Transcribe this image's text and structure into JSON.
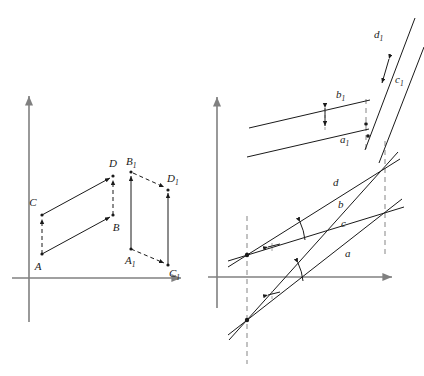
{
  "figure": {
    "type": "geometric-diagram",
    "title": "",
    "background_color": "#ffffff",
    "stroke_color": "#1a1a1a",
    "axis_color": "#808080",
    "dash_color": "#9a9a9a",
    "width": 424,
    "height": 376
  },
  "panels": [
    {
      "id": "left",
      "name": "point-figure-panel",
      "axes": {
        "origin": {
          "x": 29,
          "y": 278
        },
        "y_axis": {
          "x": 29,
          "y_top": 92,
          "y_bottom": 322,
          "arrow": "up"
        },
        "x_axis": {
          "y": 278,
          "x_left": 12,
          "x_right": 186,
          "arrow": "right"
        }
      },
      "shapes": [
        {
          "name": "parallelogram-ABCD",
          "points": [
            {
              "label": "A",
              "x": 42,
              "y": 254,
              "label_x": 38,
              "label_y": 268
            },
            {
              "label": "B",
              "x": 113,
              "y": 215,
              "label_x": 112,
              "label_y": 229
            },
            {
              "label": "C",
              "x": 42,
              "y": 215,
              "label_x": 33,
              "label_y": 206
            },
            {
              "label": "D",
              "x": 113,
              "y": 176,
              "label_x": 110,
              "label_y": 167
            }
          ],
          "solid_arrows": [
            {
              "from": "A",
              "to": "B"
            },
            {
              "from": "C",
              "to": "D"
            }
          ],
          "dashed_arrows": [
            {
              "from": "A",
              "to": "C"
            },
            {
              "from": "B",
              "to": "D"
            }
          ]
        },
        {
          "name": "parallelogram-A1B1C1D1",
          "points": [
            {
              "label": "A",
              "sub": "1",
              "x": 131,
              "y": 249,
              "label_x": 124,
              "label_y": 263
            },
            {
              "label": "B",
              "sub": "1",
              "x": 131,
              "y": 172,
              "label_x": 127,
              "label_y": 163
            },
            {
              "label": "C",
              "sub": "1",
              "x": 168,
              "y": 265,
              "label_x": 169,
              "label_y": 275
            },
            {
              "label": "D",
              "sub": "1",
              "x": 168,
              "y": 190,
              "label_x": 168,
              "label_y": 180
            }
          ],
          "solid_arrows": [
            {
              "from": "A1",
              "to": "B1"
            },
            {
              "from": "C1",
              "to": "D1"
            }
          ],
          "dashed_arrows": [
            {
              "from": "A1",
              "to": "C1"
            },
            {
              "from": "B1",
              "to": "D1"
            }
          ]
        }
      ]
    },
    {
      "id": "right",
      "name": "line-figure-panel",
      "axes": {
        "origin": {
          "x": 217,
          "y": 277
        },
        "y_axis": {
          "x": 217,
          "y_top": 93,
          "y_bottom": 308,
          "arrow": "up"
        },
        "x_axis": {
          "y": 277,
          "x_left": 208,
          "x_right": 397,
          "arrow": "right"
        }
      },
      "line_labels": [
        {
          "label": "a",
          "x": 348,
          "y": 254
        },
        {
          "label": "b",
          "x": 341,
          "y": 205
        },
        {
          "label": "c",
          "x": 345,
          "y": 224
        },
        {
          "label": "d",
          "x": 336,
          "y": 183
        },
        {
          "label": "a",
          "sub": "1",
          "x": 345,
          "y": 139
        },
        {
          "label": "b",
          "sub": "1",
          "x": 341,
          "y": 96
        },
        {
          "label": "c",
          "sub": "1",
          "x": 400,
          "y": 81
        },
        {
          "label": "d",
          "sub": "1",
          "x": 380,
          "y": 36
        }
      ],
      "dashed_verticals": [
        {
          "name": "dashed-vertical-left",
          "x": 247,
          "y1": 215,
          "y2": 365
        },
        {
          "name": "dashed-vertical-right",
          "x": 385,
          "y1": 140,
          "y2": 260
        },
        {
          "name": "dashed-vertical-upper",
          "x": 365,
          "y1": 100,
          "y2": 155
        }
      ],
      "angle_marks": [
        {
          "name": "angle-arc-upper",
          "cx": 247,
          "cy": 255,
          "label": "arc-between-c-and-d"
        },
        {
          "name": "angle-arc-lower",
          "cx": 247,
          "cy": 320,
          "label": "arc-between-a-and-b"
        }
      ],
      "distance_marks": [
        {
          "name": "distance-mark-a1b1",
          "x": 325,
          "y1": 101,
          "y2": 129
        },
        {
          "name": "distance-mark-c1d1",
          "x": 388,
          "y1": 57,
          "y2": 85
        }
      ]
    }
  ]
}
